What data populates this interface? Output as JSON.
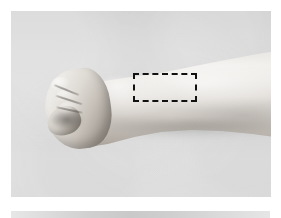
{
  "figure": {
    "kind": "photograph",
    "modality": "grayscale-clinical-photo",
    "background_color": "#d6d6d6",
    "caption": ""
  },
  "photo": {
    "frame": {
      "x": 11,
      "y": 11,
      "width": 260,
      "height": 186
    },
    "background_color": "#d6d6d6",
    "border_margin_color": "#ffffff"
  },
  "annotations": {
    "region_of_interest": {
      "name": "dashed-region-box",
      "shape": "rectangle",
      "style": "dashed",
      "color": "#111111",
      "line_width_px": 2.5,
      "label": "",
      "bounds": {
        "x": 133,
        "y": 73,
        "width": 64,
        "height": 29
      },
      "description": "dashed rectangle over distal forearm / wrist region"
    }
  },
  "anatomy": {
    "fist": {
      "name": "clenched-fist",
      "bounds": {
        "x": 45,
        "y": 69,
        "width": 60,
        "height": 68
      },
      "orientation": "pointing left"
    },
    "forearm": {
      "name": "forearm",
      "bounds": {
        "x": 85,
        "y": 51,
        "width": 186,
        "height": 96
      },
      "orientation": "extending to the right, widening toward elbow"
    },
    "wrist": {
      "name": "wrist",
      "bounds": {
        "x": 100,
        "y": 66,
        "width": 40,
        "height": 56
      }
    }
  },
  "next_figure_strip": {
    "name": "next-figure-top-edge",
    "bounds": {
      "x": 11,
      "y": 211,
      "width": 259,
      "height": 7
    },
    "description": "top edge of the following photograph on the page"
  }
}
